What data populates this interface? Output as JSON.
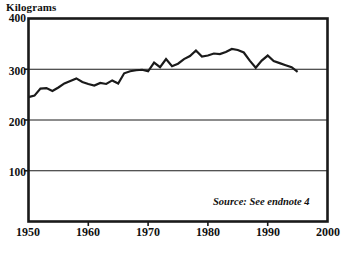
{
  "chart_data": {
    "type": "line",
    "title": "",
    "ylabel": "Kilograms",
    "xlabel": "",
    "ylim": [
      0,
      400
    ],
    "xlim": [
      1950,
      2000
    ],
    "yticks": [
      0,
      100,
      200,
      300,
      400
    ],
    "ytick_labels": [
      "",
      "100",
      "200",
      "300",
      "400"
    ],
    "xticks": [
      1950,
      1960,
      1970,
      1980,
      1990,
      2000
    ],
    "xtick_labels": [
      "1950",
      "1960",
      "1970",
      "1980",
      "1990",
      "2000"
    ],
    "grid": "horizontal",
    "legend": "none",
    "line_color": "#1a1a1a",
    "annotation": "Source: See endnote 4",
    "x": [
      1950,
      1951,
      1952,
      1953,
      1954,
      1955,
      1956,
      1957,
      1958,
      1959,
      1960,
      1961,
      1962,
      1963,
      1964,
      1965,
      1966,
      1967,
      1968,
      1969,
      1970,
      1971,
      1972,
      1973,
      1974,
      1975,
      1976,
      1977,
      1978,
      1979,
      1980,
      1981,
      1982,
      1983,
      1984,
      1985,
      1986,
      1987,
      1988,
      1989,
      1990,
      1991,
      1992,
      1993,
      1994,
      1995
    ],
    "values": [
      245,
      248,
      262,
      263,
      257,
      264,
      272,
      277,
      282,
      275,
      271,
      268,
      273,
      271,
      278,
      272,
      292,
      296,
      298,
      299,
      296,
      313,
      304,
      320,
      306,
      311,
      320,
      326,
      337,
      325,
      327,
      331,
      330,
      334,
      340,
      338,
      333,
      317,
      303,
      317,
      327,
      316,
      312,
      308,
      304,
      295
    ]
  }
}
